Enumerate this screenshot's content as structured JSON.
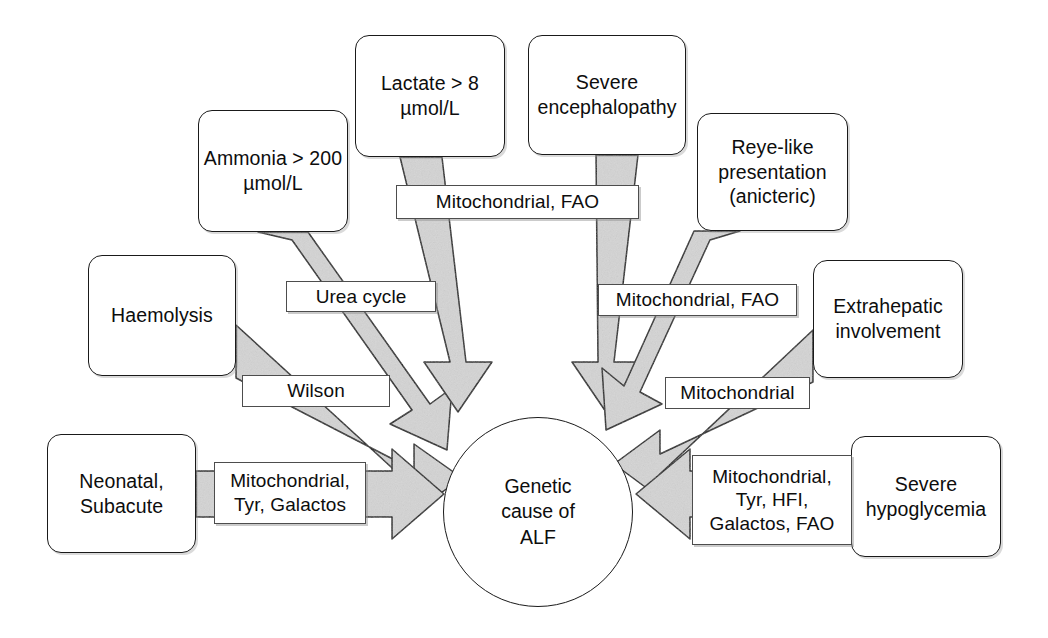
{
  "diagram": {
    "type": "radial-cause-diagram",
    "hub": {
      "label": "Genetic\ncause of\nALF",
      "shape": "ellipse"
    },
    "nodes": [
      {
        "id": "ammonia",
        "label": "Ammonia > 200\nµmol/L"
      },
      {
        "id": "lactate",
        "label": "Lactate > 8\nµmol/L"
      },
      {
        "id": "encephalopathy",
        "label": "Severe\nencephalopathy"
      },
      {
        "id": "reye",
        "label": "Reye-like\npresentation\n(anicteric)"
      },
      {
        "id": "haemolysis",
        "label": "Haemolysis"
      },
      {
        "id": "extrahepatic",
        "label": "Extrahepatic\ninvolvement"
      },
      {
        "id": "neonatal",
        "label": "Neonatal,\nSubacute"
      },
      {
        "id": "hypoglycemia",
        "label": "Severe\nhypoglycemia"
      }
    ],
    "edge_labels": [
      {
        "id": "urea-cycle",
        "from": "ammonia",
        "label": "Urea cycle"
      },
      {
        "id": "mito-fao-top",
        "from": "lactate, encephalopathy",
        "label": "Mitochondrial, FAO"
      },
      {
        "id": "mito-fao-right",
        "from": "reye",
        "label": "Mitochondrial, FAO"
      },
      {
        "id": "wilson",
        "from": "haemolysis",
        "label": "Wilson"
      },
      {
        "id": "mitochondrial",
        "from": "extrahepatic",
        "label": "Mitochondrial"
      },
      {
        "id": "mito-tyr-galactos",
        "from": "neonatal",
        "label": "Mitochondrial,\nTyr, Galactos"
      },
      {
        "id": "mito-tyr-hfi-galactos-fao",
        "from": "hypoglycemia",
        "label": "Mitochondrial,\nTyr, HFI,\nGalactos, FAO"
      }
    ],
    "colors": {
      "arrow_fill": "#d4d4d4",
      "arrow_stroke": "#1a1a1a",
      "node_border": "#1a1a1a",
      "background": "#ffffff",
      "text": "#0d0d0d"
    }
  }
}
